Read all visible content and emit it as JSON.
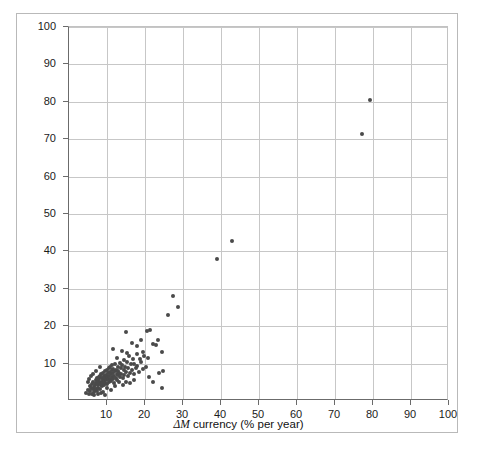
{
  "chart_data": {
    "type": "scatter",
    "title": "",
    "xlabel": "ΔM currency (% per year)",
    "xlabel_symbol": "ΔM",
    "xlabel_rest": " currency (% per year)",
    "ylabel": "ΔP (% per year)",
    "ylabel_symbol": "ΔP",
    "ylabel_rest": " (% per year)",
    "xlim": [
      0,
      100
    ],
    "ylim": [
      0,
      100
    ],
    "xticks": [
      10,
      20,
      30,
      40,
      50,
      60,
      70,
      80,
      90,
      100
    ],
    "yticks": [
      10,
      20,
      30,
      40,
      50,
      60,
      70,
      80,
      90,
      100
    ],
    "grid": true,
    "legend": null,
    "marker_color": "#4a4a4a",
    "marker_size": 4,
    "points": [
      [
        4.6,
        2.2
      ],
      [
        5.0,
        3.0
      ],
      [
        5.2,
        1.8
      ],
      [
        5.4,
        4.1
      ],
      [
        5.6,
        2.6
      ],
      [
        5.8,
        3.5
      ],
      [
        6.0,
        2.0
      ],
      [
        6.1,
        4.6
      ],
      [
        6.2,
        3.1
      ],
      [
        6.4,
        5.2
      ],
      [
        6.5,
        2.4
      ],
      [
        6.6,
        3.8
      ],
      [
        6.8,
        4.4
      ],
      [
        6.9,
        2.9
      ],
      [
        7.0,
        5.6
      ],
      [
        7.1,
        3.3
      ],
      [
        7.2,
        4.9
      ],
      [
        7.3,
        6.1
      ],
      [
        7.4,
        2.7
      ],
      [
        7.5,
        4.2
      ],
      [
        7.6,
        5.4
      ],
      [
        7.7,
        3.6
      ],
      [
        7.8,
        6.4
      ],
      [
        7.9,
        4.7
      ],
      [
        8.0,
        5.9
      ],
      [
        8.1,
        3.2
      ],
      [
        8.2,
        6.8
      ],
      [
        8.3,
        4.4
      ],
      [
        8.4,
        5.1
      ],
      [
        8.5,
        7.2
      ],
      [
        8.6,
        3.9
      ],
      [
        8.7,
        6.2
      ],
      [
        8.8,
        4.8
      ],
      [
        8.9,
        5.7
      ],
      [
        9.0,
        7.6
      ],
      [
        9.1,
        4.3
      ],
      [
        9.2,
        6.6
      ],
      [
        9.3,
        5.3
      ],
      [
        9.4,
        8.0
      ],
      [
        9.5,
        4.9
      ],
      [
        9.6,
        6.1
      ],
      [
        9.7,
        7.0
      ],
      [
        9.8,
        5.5
      ],
      [
        9.9,
        8.4
      ],
      [
        10.0,
        6.3
      ],
      [
        10.1,
        4.6
      ],
      [
        10.2,
        7.4
      ],
      [
        10.3,
        5.8
      ],
      [
        10.4,
        8.8
      ],
      [
        10.5,
        6.7
      ],
      [
        10.6,
        5.1
      ],
      [
        10.7,
        7.8
      ],
      [
        10.8,
        6.0
      ],
      [
        10.9,
        9.1
      ],
      [
        11.0,
        7.1
      ],
      [
        11.1,
        5.4
      ],
      [
        11.2,
        8.2
      ],
      [
        11.3,
        6.4
      ],
      [
        11.4,
        9.5
      ],
      [
        11.5,
        7.5
      ],
      [
        11.6,
        5.8
      ],
      [
        11.7,
        8.6
      ],
      [
        11.8,
        6.8
      ],
      [
        11.9,
        4.9
      ],
      [
        12.0,
        7.9
      ],
      [
        12.2,
        9.8
      ],
      [
        12.3,
        6.2
      ],
      [
        12.4,
        8.3
      ],
      [
        12.5,
        7.2
      ],
      [
        12.6,
        5.6
      ],
      [
        12.8,
        9.2
      ],
      [
        12.9,
        6.9
      ],
      [
        13.0,
        8.0
      ],
      [
        13.2,
        7.6
      ],
      [
        13.4,
        10.2
      ],
      [
        13.5,
        6.5
      ],
      [
        13.6,
        8.8
      ],
      [
        13.8,
        7.3
      ],
      [
        14.0,
        9.6
      ],
      [
        14.2,
        6.1
      ],
      [
        14.4,
        8.4
      ],
      [
        14.5,
        11.0
      ],
      [
        14.6,
        7.0
      ],
      [
        14.8,
        9.1
      ],
      [
        15.0,
        7.8
      ],
      [
        15.2,
        10.4
      ],
      [
        15.4,
        6.6
      ],
      [
        15.6,
        8.7
      ],
      [
        15.8,
        12.1
      ],
      [
        16.0,
        7.4
      ],
      [
        16.2,
        9.9
      ],
      [
        16.5,
        8.2
      ],
      [
        16.8,
        11.3
      ],
      [
        17.0,
        7.1
      ],
      [
        17.2,
        10.0
      ],
      [
        17.5,
        8.9
      ],
      [
        17.8,
        12.6
      ],
      [
        18.0,
        9.4
      ],
      [
        18.3,
        7.7
      ],
      [
        18.6,
        11.1
      ],
      [
        19.0,
        10.3
      ],
      [
        19.4,
        8.5
      ],
      [
        19.8,
        12.0
      ],
      [
        20.2,
        9.2
      ],
      [
        5.3,
        6.0
      ],
      [
        6.3,
        7.3
      ],
      [
        7.05,
        8.1
      ],
      [
        8.05,
        9.0
      ],
      [
        9.05,
        2.3
      ],
      [
        10.05,
        3.4
      ],
      [
        11.05,
        3.0
      ],
      [
        12.05,
        4.1
      ],
      [
        6.7,
        1.6
      ],
      [
        7.65,
        1.9
      ],
      [
        8.45,
        2.1
      ],
      [
        9.35,
        1.7
      ],
      [
        4.9,
        5.0
      ],
      [
        5.9,
        6.7
      ],
      [
        13.1,
        5.0
      ],
      [
        14.1,
        4.4
      ],
      [
        15.1,
        5.2
      ],
      [
        16.1,
        4.8
      ],
      [
        17.1,
        5.5
      ],
      [
        12.7,
        11.6
      ],
      [
        13.9,
        13.5
      ],
      [
        11.6,
        14.0
      ],
      [
        14.9,
        18.4
      ],
      [
        15.3,
        12.8
      ],
      [
        16.6,
        15.6
      ],
      [
        17.9,
        14.8
      ],
      [
        18.9,
        16.4
      ],
      [
        19.6,
        13.2
      ],
      [
        20.6,
        18.6
      ],
      [
        21.4,
        18.9
      ],
      [
        20.9,
        11.6
      ],
      [
        22.1,
        15.2
      ],
      [
        22.8,
        15.0
      ],
      [
        23.4,
        16.2
      ],
      [
        24.4,
        13.0
      ],
      [
        23.8,
        7.6
      ],
      [
        24.8,
        7.9
      ],
      [
        24.6,
        3.6
      ],
      [
        21.0,
        6.5
      ],
      [
        22.0,
        5.0
      ],
      [
        26.0,
        23.0
      ],
      [
        27.4,
        28.0
      ],
      [
        28.8,
        25.2
      ],
      [
        39.0,
        38.0
      ],
      [
        43.0,
        42.8
      ],
      [
        77.0,
        71.5
      ],
      [
        79.2,
        80.5
      ]
    ]
  }
}
